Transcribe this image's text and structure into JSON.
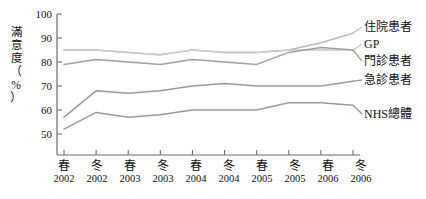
{
  "chart_data": {
    "type": "line",
    "title": "",
    "xlabel": "",
    "ylabel": "滿意度（%）",
    "ylim": [
      45,
      100
    ],
    "yticks": [
      50,
      60,
      70,
      80,
      90,
      100
    ],
    "grid": false,
    "legend_position": "right",
    "categories": [
      "春 2002",
      "冬 2002",
      "春 2003",
      "冬 2003",
      "春 2004",
      "冬 2004",
      "春 2005",
      "冬 2005",
      "春 2006",
      "冬 2006"
    ],
    "x_tick_seasons": [
      "春",
      "冬",
      "春",
      "冬",
      "春",
      "冬",
      "春",
      "冬",
      "春",
      "冬"
    ],
    "x_tick_years": [
      "2002",
      "2002",
      "2003",
      "2003",
      "2004",
      "2004",
      "2005",
      "2005",
      "2006",
      "2006"
    ],
    "series": [
      {
        "name": "住院患者",
        "color": "#b9b9b9",
        "values": [
          85,
          85,
          84,
          83,
          85,
          84,
          84,
          85,
          88,
          92
        ]
      },
      {
        "name": "GP",
        "color": "#c9c9c9",
        "values": [
          85,
          85,
          84,
          83,
          85,
          84,
          84,
          85,
          85,
          85
        ]
      },
      {
        "name": "門診患者",
        "color": "#a0a0a0",
        "values": [
          79,
          81,
          80,
          79,
          81,
          80,
          79,
          84,
          86,
          85
        ]
      },
      {
        "name": "急診患者",
        "color": "#9a9a9a",
        "values": [
          57,
          68,
          67,
          68,
          70,
          71,
          70,
          70,
          70,
          72
        ]
      },
      {
        "name": "NHS總體",
        "color": "#9a9a9a",
        "values": [
          52,
          59,
          57,
          58,
          60,
          60,
          60,
          63,
          63,
          62
        ]
      }
    ]
  },
  "axis": {
    "y_tick_labels": [
      "100",
      "90",
      "80",
      "70",
      "60",
      "50"
    ],
    "y_axis_title_chars": [
      "滿",
      "意",
      "度"
    ],
    "y_axis_title_unit": "（%）",
    "y_axis_unit_glyph": "%"
  },
  "legend": {
    "items": [
      {
        "label": "住院患者"
      },
      {
        "label": "GP"
      },
      {
        "label": "門診患者"
      },
      {
        "label": "急診患者"
      },
      {
        "label": "NHS總體"
      }
    ]
  }
}
